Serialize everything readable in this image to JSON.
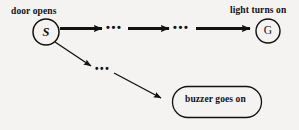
{
  "diagram": {
    "background_color": "#f4f3f1",
    "stroke_color": "#111111",
    "nodes": [
      {
        "id": "start",
        "letter": "S",
        "shape": "circle",
        "cx": 46,
        "cy": 32,
        "r": 13,
        "label": "door opens",
        "label_position": "above-left"
      },
      {
        "id": "goal",
        "letter": "G",
        "shape": "circle",
        "cx": 268,
        "cy": 31,
        "r": 12,
        "label": "light turns on",
        "label_position": "above"
      },
      {
        "id": "buzzer",
        "letter": "",
        "shape": "rounded-rectangle",
        "x": 172,
        "y": 86,
        "width": 90,
        "height": 32,
        "label": "buzzer goes on",
        "label_position": "inside"
      }
    ],
    "ellipses": [
      {
        "id": "ellipsis-top-1",
        "text": "•••",
        "x": 106,
        "y": 22,
        "branch": "main"
      },
      {
        "id": "ellipsis-top-2",
        "text": "•••",
        "x": 173,
        "y": 22,
        "branch": "main"
      },
      {
        "id": "ellipsis-branch-1",
        "text": "•••",
        "x": 95,
        "y": 64,
        "branch": "secondary"
      }
    ],
    "edges": [
      {
        "id": "edge-s-to-dots1",
        "from": "start",
        "to": "ellipsis-top-1",
        "style": "thick",
        "direction": "right"
      },
      {
        "id": "edge-dots1-to-dots2",
        "from": "ellipsis-top-1",
        "to": "ellipsis-top-2",
        "style": "thick",
        "direction": "right"
      },
      {
        "id": "edge-dots2-to-goal",
        "from": "ellipsis-top-2",
        "to": "goal",
        "style": "thick",
        "direction": "right"
      },
      {
        "id": "edge-s-to-branchdots",
        "from": "start",
        "to": "ellipsis-branch-1",
        "style": "thin",
        "direction": "down-right"
      },
      {
        "id": "edge-branchdots-to-buzzer",
        "from": "ellipsis-branch-1",
        "to": "buzzer",
        "style": "thin",
        "direction": "down-right"
      }
    ]
  },
  "labels": {
    "door_opens": "door opens",
    "light_turns_on": "light turns on",
    "buzzer_goes_on": "buzzer goes on",
    "start_letter": "S",
    "goal_letter": "G",
    "ellipsis": "•••"
  }
}
